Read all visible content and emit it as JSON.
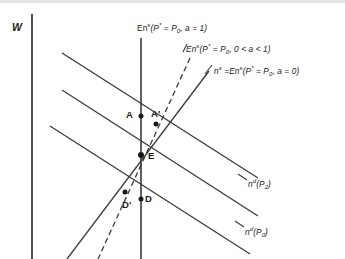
{
  "figure": {
    "axis": {
      "y_label": "W"
    },
    "curve_labels": [
      {
        "id": "en-s-a-equals-1",
        "parts": [
          {
            "t": "En",
            "s": "base"
          },
          {
            "t": "s",
            "s": "up"
          },
          {
            "t": "(P",
            "s": "base"
          },
          {
            "t": "*",
            "s": "up"
          },
          {
            "t": " = P",
            "s": "base"
          },
          {
            "t": "0",
            "s": "dn"
          },
          {
            "t": ", a = 1)",
            "s": "base"
          }
        ],
        "plain": "En s(P* = P0, a = 1)",
        "x": 137,
        "y": 22
      },
      {
        "id": "en-s-a-between-0-and-1",
        "parts": [
          {
            "t": "En",
            "s": "base"
          },
          {
            "t": "s",
            "s": "up"
          },
          {
            "t": "(P",
            "s": "base"
          },
          {
            "t": "*",
            "s": "up"
          },
          {
            "t": " = P",
            "s": "base"
          },
          {
            "t": "0",
            "s": "dn"
          },
          {
            "t": ", 0 < a < 1)",
            "s": "base"
          }
        ],
        "plain": "En s(P* = P0, 0 < a < 1)",
        "x": 186,
        "y": 43
      },
      {
        "id": "n-s-en-s-a-equals-0",
        "parts": [
          {
            "t": "n",
            "s": "base"
          },
          {
            "t": "s",
            "s": "up"
          },
          {
            "t": " =",
            "s": "base"
          },
          {
            "t": "En",
            "s": "base"
          },
          {
            "t": "s",
            "s": "up"
          },
          {
            "t": "(P",
            "s": "base"
          },
          {
            "t": "*",
            "s": "up"
          },
          {
            "t": " = P",
            "s": "base"
          },
          {
            "t": "0",
            "s": "dn"
          },
          {
            "t": ", a = 0)",
            "s": "base"
          }
        ],
        "plain": "n s =En s(P* = P0, a = 0)",
        "x": 214,
        "y": 65
      },
      {
        "id": "n-d-p2",
        "parts": [
          {
            "t": "n",
            "s": "base"
          },
          {
            "t": "d",
            "s": "up"
          },
          {
            "t": "(P",
            "s": "base"
          },
          {
            "t": "2",
            "s": "dn"
          },
          {
            "t": ")",
            "s": "base"
          }
        ],
        "plain": "n d(P2)",
        "x": 248,
        "y": 178
      },
      {
        "id": "n-d-p0",
        "parts": [
          {
            "t": "n",
            "s": "base"
          },
          {
            "t": "d",
            "s": "up"
          },
          {
            "t": "(P",
            "s": "base"
          },
          {
            "t": "0",
            "s": "dn"
          },
          {
            "t": ")",
            "s": "base"
          }
        ],
        "plain": "n d(P0)",
        "x": 245,
        "y": 226
      }
    ],
    "point_labels": [
      {
        "id": "point-a",
        "text": "A",
        "x": 126,
        "y": 110
      },
      {
        "id": "point-a-prime",
        "text": "A'",
        "x": 151,
        "y": 109
      },
      {
        "id": "point-e",
        "text": "E",
        "x": 148,
        "y": 151
      },
      {
        "id": "point-d-prime",
        "text": "D'",
        "x": 122,
        "y": 200
      },
      {
        "id": "point-d",
        "text": "D",
        "x": 145,
        "y": 194
      }
    ],
    "markers": [
      {
        "id": "marker-a",
        "cx": 141,
        "cy": 116
      },
      {
        "id": "marker-a-prime",
        "cx": 156,
        "cy": 124
      },
      {
        "id": "marker-e",
        "cx": 141,
        "cy": 155
      },
      {
        "id": "marker-d-prime",
        "cx": 125,
        "cy": 192
      },
      {
        "id": "marker-d",
        "cx": 141,
        "cy": 199
      }
    ],
    "colors": {
      "ink": "#1a1a1a",
      "line": "#3a3a3a",
      "background": "#ffffff",
      "top_stripe": "#e3e3e3"
    }
  }
}
